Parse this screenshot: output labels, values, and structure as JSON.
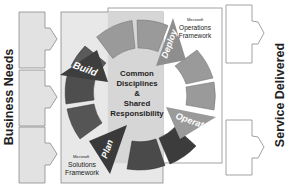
{
  "diagram": {
    "left_label": "Business Needs",
    "right_label": "Service Delivered",
    "msf": {
      "small": "Microsoft",
      "line1": "Solutions",
      "line2": "Framework"
    },
    "mof": {
      "small": "Microsoft",
      "line1": "Operations",
      "line2": "Framework"
    },
    "center": {
      "line1": "Common",
      "line2": "Disciplines",
      "line3": "&",
      "line4": "Shared",
      "line5": "Responsibility"
    },
    "phases": {
      "build": "Build",
      "deploy": "Deploy",
      "operate": "Operate",
      "plan": "Plan"
    },
    "colors": {
      "msf_bg": "#e6e6e6",
      "mof_bg": "#ffffff",
      "center_bg": "#d4d4d4",
      "segment_light": "#9a9a9a",
      "segment_dark": "#4a4a4a",
      "segment_mid": "#6c6c6c",
      "input_box": "#e2e2e2",
      "border": "#888888"
    }
  }
}
